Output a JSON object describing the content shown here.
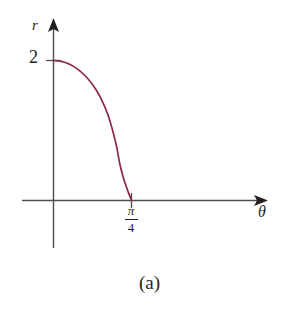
{
  "figure": {
    "caption": "(a)",
    "background_color": "#ffffff",
    "axis_color": "#4d4d4d",
    "text_color": "#231f20"
  },
  "chart_data": {
    "type": "line",
    "title": "",
    "subtitle": "",
    "xlabel": "θ",
    "ylabel": "r",
    "curve_color": "#8B2942",
    "grid": false,
    "legend": null,
    "xlim": [
      -0.14,
      1.1
    ],
    "ylim": [
      -0.33,
      2.6
    ],
    "xticks": [
      {
        "value": 0.7853981634,
        "label_numerator": "π",
        "label_denominator": "4",
        "label": "π/4"
      }
    ],
    "yticks": [
      {
        "value": 2,
        "label": "2"
      }
    ],
    "annotations": [
      {
        "name": "y-axis-arrowhead",
        "text": ""
      },
      {
        "name": "x-axis-arrowhead",
        "text": ""
      }
    ],
    "series": [
      {
        "name": "r = 2√(cos 2θ)",
        "x": [
          0.0,
          0.0785,
          0.1571,
          0.2356,
          0.3142,
          0.3927,
          0.4712,
          0.5498,
          0.6283,
          0.6676,
          0.7069,
          0.7265,
          0.7461,
          0.7559,
          0.7658,
          0.7756,
          0.7805,
          0.7829,
          0.7842,
          0.7854
        ],
        "y": [
          2.0,
          1.9876,
          1.9497,
          1.8845,
          1.7889,
          1.6569,
          1.4768,
          1.2181,
          0.8165,
          0.5219,
          0.3102,
          0.2255,
          0.1457,
          0.1084,
          0.0729,
          0.0402,
          0.0254,
          0.0138,
          0.0058,
          0.0
        ]
      }
    ]
  },
  "labels": {
    "r_axis": "r",
    "theta_axis": "θ",
    "y_tick_2": "2",
    "pi_numerator": "π",
    "pi_denominator": "4",
    "caption": "(a)"
  }
}
